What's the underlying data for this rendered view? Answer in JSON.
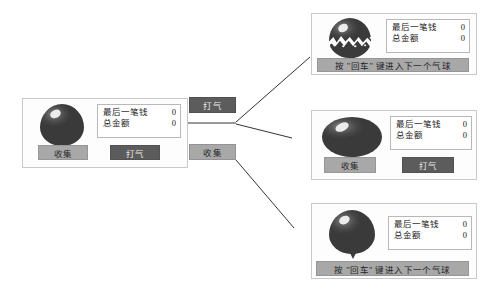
{
  "readout": {
    "last_label": "最后一笔钱",
    "last_value": "0",
    "total_label": "总金额",
    "total_value": "0"
  },
  "actions": {
    "collect_label": "收集",
    "pump_label": "打气",
    "next_banner": "按 \"回车\" 键进入下一个气球"
  },
  "nodes": {
    "pump": "打气",
    "collect": "收集"
  },
  "panels": {
    "start": {
      "name": "起始气球状态",
      "balloon_state": "intact",
      "readout": {
        "last_value": "0",
        "total_value": "0"
      },
      "buttons": [
        "收集",
        "打气"
      ]
    },
    "popped": {
      "name": "气球爆炸状态",
      "balloon_state": "popped",
      "readout": {
        "last_value": "0",
        "total_value": "0"
      },
      "footer": "按 \"回车\" 键进入下一个气球"
    },
    "inflated": {
      "name": "气球变大状态",
      "balloon_state": "inflated",
      "readout": {
        "last_value": "0",
        "total_value": "0"
      },
      "buttons": [
        "收集",
        "打气"
      ]
    },
    "collected": {
      "name": "收集完成状态",
      "balloon_state": "intact",
      "readout": {
        "last_value": "0",
        "total_value": "0"
      },
      "footer": "按 \"回车\" 键进入下一个气球"
    }
  },
  "colors": {
    "balloon": "#4a4a4a",
    "button_light": "#a8a8a8",
    "button_dark": "#5c5c5c",
    "panel_border": "#c9c9c9",
    "connector": "#333333"
  }
}
